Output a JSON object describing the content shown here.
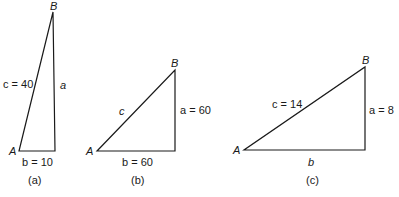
{
  "figures": [
    {
      "caption": "(a)",
      "vertex_A": "A",
      "vertex_B": "B",
      "side_c": "c = 40",
      "side_a": "a",
      "side_b": "b = 10"
    },
    {
      "caption": "(b)",
      "vertex_A": "A",
      "vertex_B": "B",
      "side_c": "c",
      "side_a": "a = 60",
      "side_b": "b = 60"
    },
    {
      "caption": "(c)",
      "vertex_A": "A",
      "vertex_B": "B",
      "side_c": "c = 14",
      "side_a": "a = 8",
      "side_b": "b"
    }
  ]
}
